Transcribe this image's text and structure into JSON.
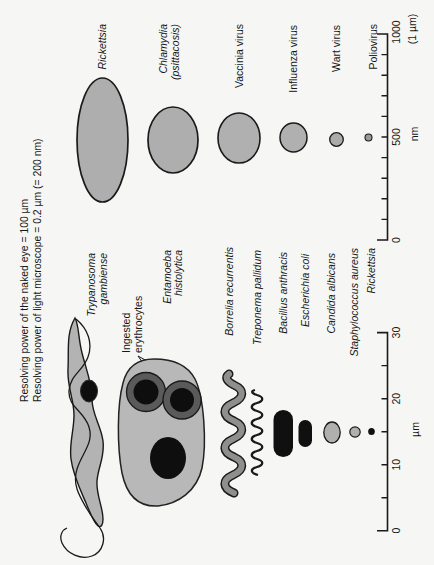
{
  "title": {
    "line1": "Resolving power of the naked eye = 100 µm",
    "line2": "Resolving power of light microscope = 0.2 µm (= 200 nm)"
  },
  "um_section": {
    "organisms": [
      {
        "id": "trypanosoma",
        "line1": "Trypanosoma",
        "line2": "gambiense"
      },
      {
        "id": "entamoeba",
        "line1": "Entamoeba",
        "line2": "histolytica"
      },
      {
        "id": "borrelia",
        "label": "Borrelia recurrentis"
      },
      {
        "id": "treponema",
        "label": "Treponema pallidum"
      },
      {
        "id": "bacillus",
        "label": "Bacillus anthracis"
      },
      {
        "id": "ecoli",
        "label": "Escherichia coli"
      },
      {
        "id": "candida",
        "label": "Candida albicans"
      },
      {
        "id": "staphylococcus",
        "label": "Staphylococcus aureus"
      },
      {
        "id": "rickettsia_small",
        "label": "Rickettsia"
      }
    ],
    "annotation": {
      "line1": "Ingested",
      "line2": "erythrocytes"
    },
    "axis": {
      "unit": "µm",
      "ticks": [
        "0",
        "10",
        "20",
        "30"
      ],
      "range": [
        0,
        30
      ],
      "minor_step": 5
    }
  },
  "nm_section": {
    "organisms": [
      {
        "id": "rickettsia",
        "label": "Rickettsia"
      },
      {
        "id": "chlamydia",
        "line1": "Chlamydia",
        "line2": "(psittacosis)"
      },
      {
        "id": "vaccinia",
        "label": "Vaccinia virus"
      },
      {
        "id": "influenza",
        "label": "Influenza virus"
      },
      {
        "id": "wart",
        "label": "Wart virus"
      },
      {
        "id": "poliovirus",
        "label": "Poliovirus"
      }
    ],
    "axis": {
      "unit": "nm",
      "ticks": [
        "0",
        "500",
        "1000"
      ],
      "equiv_label": "(1 µm)",
      "range": [
        0,
        1000
      ],
      "minor_step": 100
    }
  },
  "colors": {
    "background": "#f6f6f4",
    "organism_gray": "#aeaeae",
    "body_gray": "#b7b7b7",
    "tube_gray": "#8f8f8f",
    "ring_gray": "#5a5a5a",
    "dark": "#101010",
    "outline": "#1a1a1a"
  }
}
